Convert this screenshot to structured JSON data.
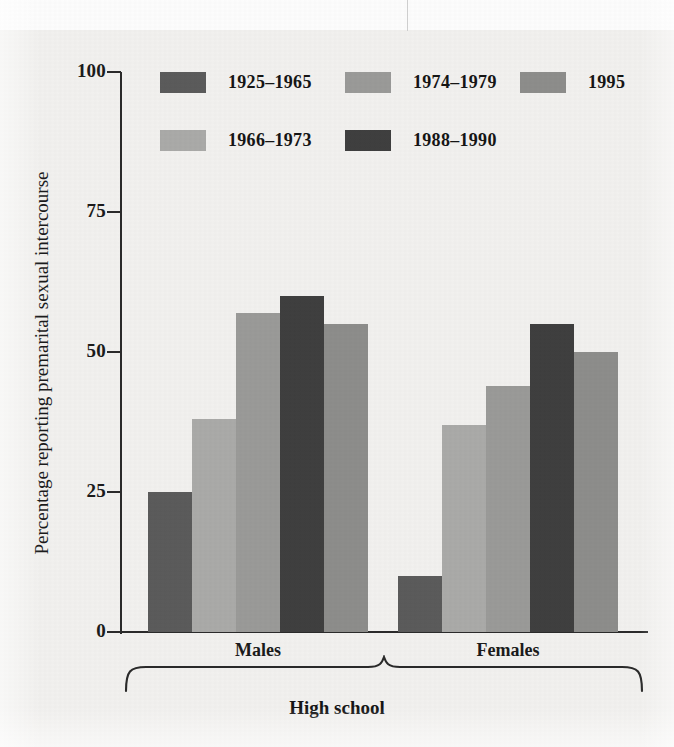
{
  "figure": {
    "background_color": "#f2f1ef",
    "axis_color": "#2a2a2a",
    "text_color": "#1b1b1b"
  },
  "chart_data": {
    "type": "bar",
    "title": "",
    "subtitle": "",
    "xlabel": "High school",
    "ylabel": "Percentage reporting premarital sexual intercourse",
    "ylim": [
      0,
      100
    ],
    "yticks": [
      0,
      25,
      50,
      75,
      100
    ],
    "ytick_labels": [
      "0",
      "25",
      "50",
      "75",
      "100"
    ],
    "grid": false,
    "legend_position": "top-left-inside",
    "categories": [
      "Males",
      "Females"
    ],
    "series": [
      {
        "name": "1925–1965",
        "color": "#5b5b5b",
        "values": [
          25,
          10
        ]
      },
      {
        "name": "1966–1973",
        "color": "#aaaaa8",
        "values": [
          38,
          37
        ]
      },
      {
        "name": "1974–1979",
        "color": "#9a9a98",
        "values": [
          57,
          44
        ]
      },
      {
        "name": "1988–1990",
        "color": "#3f3f3f",
        "values": [
          60,
          55
        ]
      },
      {
        "name": "1995",
        "color": "#8d8d8b",
        "values": [
          55,
          50
        ]
      }
    ],
    "group_bracket_label": "High school"
  },
  "axis": {
    "y_title": "Percentage reporting premarital sexual intercourse",
    "ticks": [
      {
        "label": "100",
        "value": 100
      },
      {
        "label": "75",
        "value": 75
      },
      {
        "label": "50",
        "value": 50
      },
      {
        "label": "25",
        "value": 25
      },
      {
        "label": "0",
        "value": 0
      }
    ]
  },
  "legend": {
    "items": [
      {
        "label": "1925–1965",
        "color": "#5b5b5b"
      },
      {
        "label": "1966–1973",
        "color": "#aaaaa8"
      },
      {
        "label": "1974–1979",
        "color": "#9a9a98"
      },
      {
        "label": "1988–1990",
        "color": "#3f3f3f"
      },
      {
        "label": "1995",
        "color": "#8d8d8b"
      }
    ]
  },
  "groups": [
    {
      "label": "Males"
    },
    {
      "label": "Females"
    }
  ],
  "bracket": {
    "label": "High school"
  }
}
